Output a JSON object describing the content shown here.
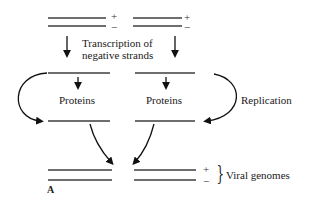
{
  "diagram": {
    "labels": {
      "transcription_line1": "Transcription of",
      "transcription_line2": "negative strands",
      "proteins_left": "Proteins",
      "proteins_right": "Proteins",
      "replication": "Replication",
      "viral_genomes": "Viral genomes",
      "panel_letter": "A"
    },
    "signs": {
      "top_mid_plus": "+",
      "top_mid_minus": "−",
      "top_right_plus": "+",
      "top_right_minus": "−",
      "bottom_plus": "+",
      "bottom_minus": "−"
    },
    "colors": {
      "strand": "#6e6e6e",
      "arrow": "#111111",
      "text": "#1a1a1a"
    }
  }
}
